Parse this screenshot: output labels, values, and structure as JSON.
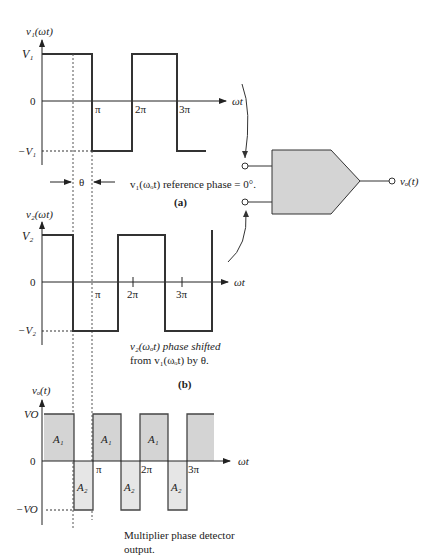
{
  "panel_a": {
    "ylabel": "v₁(ωt)",
    "top_label": "V₁",
    "zero_label": "0",
    "bottom_label": "−V₁",
    "x_axis_label": "ωt",
    "ticks": [
      "π",
      "2π",
      "3π"
    ],
    "theta_label": "θ",
    "caption": "v₁(ωₒt) reference phase = 0°.",
    "panel_label": "(a)"
  },
  "panel_b": {
    "ylabel": "v₂(ωt)",
    "top_label": "V₂",
    "zero_label": "0",
    "bottom_label": "−V₂",
    "x_axis_label": "ωt",
    "ticks": [
      "π",
      "2π",
      "3π"
    ],
    "caption_line1": "v₂(ωₒt) phase shifted",
    "caption_line2": "from v₁(ωₒt) by θ.",
    "panel_label": "(b)"
  },
  "panel_c": {
    "ylabel": "vₒ(t)",
    "top_label": "VO",
    "zero_label": "0",
    "bottom_label": "−VO",
    "x_axis_label": "ωt",
    "ticks": [
      "π",
      "2π",
      "3π"
    ],
    "area_pos": "A₁",
    "area_neg": "A₂",
    "caption_line1": "Multiplier phase detector",
    "caption_line2": "output."
  },
  "block": {
    "output_label": "vₒ(t)",
    "fill_color": "#d4d4d4"
  }
}
